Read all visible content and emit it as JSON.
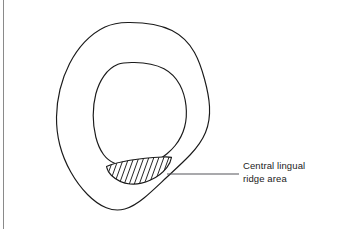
{
  "figure": {
    "type": "line-diagram",
    "annotation": {
      "label_text": "Central lingual\nridge area",
      "label_line_1": "Central lingual",
      "label_line_2": "ridge area",
      "leader_line": {
        "from_x": 168,
        "from_y": 174,
        "to_x": 238,
        "to_y": 174
      }
    },
    "regions": [
      {
        "name": "outer-contour",
        "description": "outer irregular rounded closed outline",
        "fill": "none",
        "stroke": "#1a1a1a"
      },
      {
        "name": "inner-contour",
        "description": "inner irregular rounded closed outline",
        "fill": "none",
        "stroke": "#1a1a1a"
      },
      {
        "name": "hatched-region",
        "description": "crescent shaped hatched area at bottom of inner contour",
        "fill": "diagonal-hatch",
        "stroke": "#1a1a1a",
        "hatch_line_count": 13,
        "hatch_angle_deg": 60
      }
    ],
    "colors": {
      "stroke": "#1a1a1a",
      "leader_line": "#55555a",
      "text": "#1a1a1a",
      "border": "#8a8a8a",
      "background": "#ffffff"
    }
  }
}
